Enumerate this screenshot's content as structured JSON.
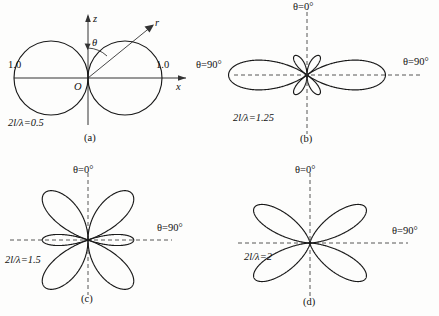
{
  "figure": {
    "type": "antenna-radiation-pattern-figure",
    "background_color": "#fdfdfc",
    "curve_color": "#1a1a1a",
    "axis_color": "#4a4a4a"
  },
  "panels": [
    {
      "id": "a",
      "caption": "(a)",
      "ratio_label": "2l/λ=0.5",
      "ratio_value": 0.5,
      "theta_zero_label": "",
      "theta_ninety_label": "θ=90°",
      "axis_z_label": "z",
      "axis_x_label": "x",
      "origin_label": "O",
      "theta_arc_label": "θ",
      "ray_label": "r",
      "scale_left_label": "1.0",
      "scale_right_label": "1.0",
      "axis_style": "solid",
      "has_axes_arrows": true,
      "lobe_count": 2
    },
    {
      "id": "b",
      "caption": "(b)",
      "ratio_label": "2l/λ=1.25",
      "ratio_value": 1.25,
      "theta_zero_label": "θ=0°",
      "theta_ninety_label": "θ=90°",
      "axis_style": "dashed",
      "has_axes_arrows": false,
      "lobe_count": 6
    },
    {
      "id": "c",
      "caption": "(c)",
      "ratio_label": "2l/λ=1.5",
      "ratio_value": 1.5,
      "theta_zero_label": "θ=0°",
      "theta_ninety_label": "θ=90°",
      "axis_style": "dashed",
      "has_axes_arrows": false,
      "lobe_count": 6
    },
    {
      "id": "d",
      "caption": "(d)",
      "ratio_label": "2l/λ=2",
      "ratio_value": 2,
      "theta_zero_label": "θ=0°",
      "theta_ninety_label": "θ=90°",
      "axis_style": "dashed",
      "has_axes_arrows": false,
      "lobe_count": 4
    }
  ],
  "chart_data": {
    "type": "line",
    "title": "",
    "subplots": [
      {
        "name": "a",
        "plot_type": "polar-radiation-pattern",
        "ratio_2l_over_lambda": 0.5,
        "normalized_max": 1.0,
        "tick_labels": [
          "1.0",
          "1.0"
        ],
        "angle_reference": {
          "theta_0": "+z axis",
          "theta_90": "+x axis"
        },
        "description": "half-wave dipole: two circular lobes along x"
      },
      {
        "name": "b",
        "plot_type": "polar-radiation-pattern",
        "ratio_2l_over_lambda": 1.25,
        "normalized_max": 1.0,
        "angle_reference": {
          "theta_0": "+z axis",
          "theta_90": "+x axis"
        },
        "description": "two large lobes near theta=90 plus four small side lobes near the axis"
      },
      {
        "name": "c",
        "plot_type": "polar-radiation-pattern",
        "ratio_2l_over_lambda": 1.5,
        "normalized_max": 1.0,
        "angle_reference": {
          "theta_0": "+z axis",
          "theta_90": "+x axis"
        },
        "description": "four large diagonal lobes plus two narrow lobes along x"
      },
      {
        "name": "d",
        "plot_type": "polar-radiation-pattern",
        "ratio_2l_over_lambda": 2,
        "normalized_max": 1.0,
        "angle_reference": {
          "theta_0": "+z axis",
          "theta_90": "+x axis"
        },
        "description": "four diagonal lobes, null along both axes"
      }
    ]
  }
}
